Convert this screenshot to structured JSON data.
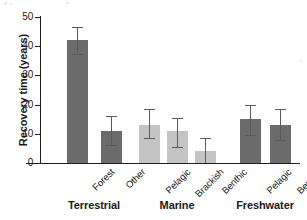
{
  "chart_data": {
    "type": "bar",
    "title": "",
    "xlabel": "",
    "ylabel": "Recovery time (years)",
    "ylim": [
      0,
      50
    ],
    "yticks": [
      0,
      10,
      20,
      30,
      40,
      50
    ],
    "grid": false,
    "legend": false,
    "error_bars": "asymmetric ranges read from caps",
    "groups": [
      {
        "name": "Terrestrial",
        "color": "#6b6b6b",
        "categories": [
          "Forest",
          "Other"
        ],
        "values": [
          42,
          11
        ],
        "err_low": [
          37.5,
          6
        ],
        "err_high": [
          46.5,
          16
        ]
      },
      {
        "name": "Marine",
        "color": "#c4c4c4",
        "categories": [
          "Pelagic",
          "Brackish",
          "Benthic"
        ],
        "values": [
          13,
          11,
          4
        ],
        "err_low": [
          8.5,
          5.5,
          0
        ],
        "err_high": [
          18.5,
          15.5,
          8.5
        ]
      },
      {
        "name": "Freshwater",
        "color": "#6b6b6b",
        "categories": [
          "Pelagic",
          "Benthic"
        ],
        "values": [
          15,
          13
        ],
        "err_low": [
          9.5,
          8
        ],
        "err_high": [
          20,
          18.5
        ]
      }
    ]
  },
  "axis": {
    "y_title": "Recovery time (years)",
    "y_tick_labels": [
      "0",
      "10",
      "20",
      "30",
      "40",
      "50"
    ]
  },
  "colors": {
    "bar_dark": "#6b6b6b",
    "bar_light": "#c4c4c4",
    "axis": "#1f1f1f",
    "error": "#5a5a5a",
    "background": "#ffffff"
  }
}
